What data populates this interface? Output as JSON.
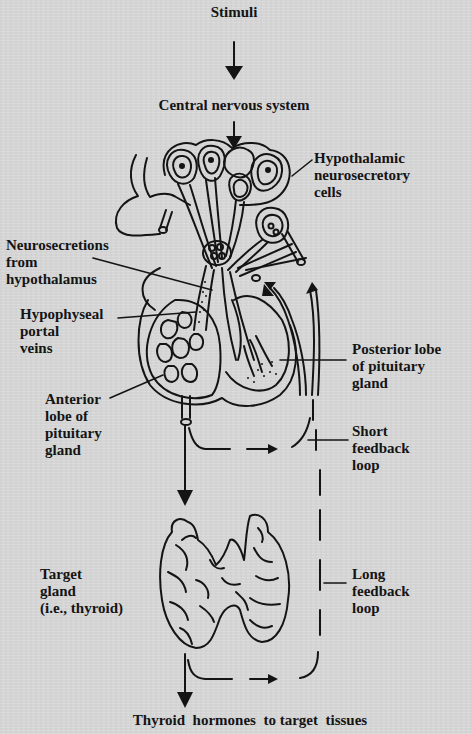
{
  "diagram": {
    "type": "hypothalamic-pituitary-thyroid feedback diagram",
    "nodes": {
      "stimuli": "Stimuli",
      "cns": "Central nervous system",
      "hypothalamic_cells": [
        "Hypothalamic",
        "neurosecretory",
        "cells"
      ],
      "neurosecretions": [
        "Neurosecretions",
        "from",
        "hypothalamus"
      ],
      "portal_veins": [
        "Hypophyseal",
        "portal",
        "veins"
      ],
      "posterior_lobe": [
        "Posterior lobe",
        "of pituitary",
        "gland"
      ],
      "anterior_lobe": [
        "Anterior",
        "lobe of",
        "pituitary",
        "gland"
      ],
      "short_feedback": [
        "Short",
        "feedback",
        "loop"
      ],
      "target_gland": [
        "Target",
        "gland",
        "(i.e., thyroid)"
      ],
      "long_feedback": [
        "Long",
        "feedback",
        "loop"
      ],
      "output": "Thyroid  hormones  to target  tissues"
    },
    "edges": [
      {
        "from": "Stimuli",
        "to": "Central nervous system",
        "style": "solid-arrow"
      },
      {
        "from": "Central nervous system",
        "to": "Hypothalamic neurosecretory cells",
        "style": "solid-arrow"
      },
      {
        "from": "Anterior lobe of pituitary gland",
        "to": "Target gland (i.e., thyroid)",
        "style": "solid-arrow"
      },
      {
        "from": "Anterior lobe of pituitary gland",
        "to": "Hypothalamus",
        "style": "dashed-arrow",
        "label": "Short feedback loop"
      },
      {
        "from": "Target gland (i.e., thyroid)",
        "to": "Hypothalamus",
        "style": "dashed-arrow",
        "label": "Long feedback loop"
      },
      {
        "from": "Target gland (i.e., thyroid)",
        "to": "Thyroid hormones to target tissues",
        "style": "solid-arrow"
      }
    ],
    "colors": {
      "background": "#d8d8d8",
      "ink": "#141414"
    }
  }
}
